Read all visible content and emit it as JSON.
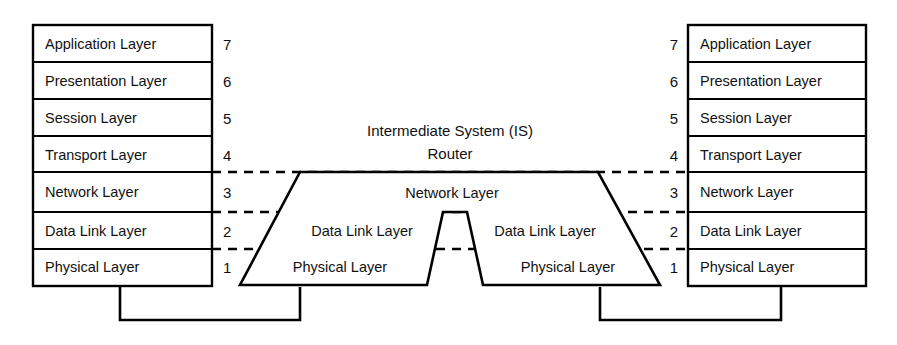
{
  "diagram": {
    "colors": {
      "stroke": "#000000",
      "background": "#ffffff",
      "text": "#111111"
    },
    "left_stack": {
      "name": "End System Left",
      "layers": [
        {
          "number": "7",
          "label": "Application Layer"
        },
        {
          "number": "6",
          "label": "Presentation Layer"
        },
        {
          "number": "5",
          "label": "Session Layer"
        },
        {
          "number": "4",
          "label": "Transport Layer"
        },
        {
          "number": "3",
          "label": "Network Layer"
        },
        {
          "number": "2",
          "label": "Data Link Layer"
        },
        {
          "number": "1",
          "label": "Physical Layer"
        }
      ]
    },
    "right_stack": {
      "name": "End System Right",
      "layers": [
        {
          "number": "7",
          "label": "Application Layer"
        },
        {
          "number": "6",
          "label": "Presentation Layer"
        },
        {
          "number": "5",
          "label": "Session Layer"
        },
        {
          "number": "4",
          "label": "Transport Layer"
        },
        {
          "number": "3",
          "label": "Network Layer"
        },
        {
          "number": "2",
          "label": "Data Link Layer"
        },
        {
          "number": "1",
          "label": "Physical Layer"
        }
      ]
    },
    "router": {
      "title_line1": "Intermediate System (IS)",
      "title_line2": "Router",
      "network_layer": "Network Layer",
      "data_link_left": "Data Link Layer",
      "data_link_right": "Data Link Layer",
      "physical_left": "Physical Layer",
      "physical_right": "Physical Layer"
    }
  }
}
